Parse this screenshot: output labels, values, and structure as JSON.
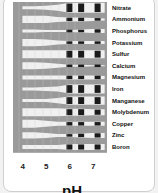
{
  "chart_data": {
    "type": "area",
    "title": "",
    "xlabel": "pH",
    "ylabel": "",
    "x_ticks": [
      "4",
      "5",
      "6",
      "7"
    ],
    "x": [
      4,
      4.5,
      5,
      5.5,
      6,
      6.5,
      7,
      7.5
    ],
    "xlim": [
      3.6,
      7.6
    ],
    "legend": "none",
    "grid": false,
    "series": [
      {
        "name": "Nitrate",
        "values": [
          0.3,
          0.3,
          0.4,
          0.6,
          1.0,
          1.0,
          1.0,
          1.0
        ]
      },
      {
        "name": "Ammonium",
        "values": [
          0.7,
          0.7,
          0.7,
          0.5,
          0.4,
          0.4,
          0.3,
          0.2
        ]
      },
      {
        "name": "Phosphorus",
        "values": [
          0.3,
          0.3,
          0.2,
          0.2,
          0.2,
          0.3,
          0.4,
          0.4
        ]
      },
      {
        "name": "Potassium",
        "values": [
          0.7,
          0.7,
          0.6,
          0.4,
          0.3,
          0.3,
          0.3,
          0.3
        ]
      },
      {
        "name": "Sulfur",
        "values": [
          0.8,
          0.8,
          0.8,
          0.8,
          0.8,
          0.8,
          0.8,
          0.8
        ]
      },
      {
        "name": "Calcium",
        "values": [
          0.7,
          0.7,
          0.6,
          0.4,
          0.2,
          0.2,
          0.1,
          0.1
        ]
      },
      {
        "name": "Magnesium",
        "values": [
          0.4,
          0.4,
          0.4,
          0.4,
          0.4,
          0.4,
          0.4,
          0.3
        ]
      },
      {
        "name": "Iron",
        "values": [
          0.3,
          0.3,
          0.4,
          0.5,
          0.9,
          0.9,
          0.9,
          0.9
        ]
      },
      {
        "name": "Manganese",
        "values": [
          0.3,
          0.3,
          0.3,
          0.5,
          0.8,
          0.8,
          0.8,
          0.8
        ]
      },
      {
        "name": "Molybdenum",
        "values": [
          0.8,
          0.8,
          0.8,
          0.8,
          0.7,
          0.7,
          0.6,
          0.6
        ]
      },
      {
        "name": "Copper",
        "values": [
          0.8,
          0.8,
          0.6,
          0.4,
          0.4,
          0.4,
          0.4,
          0.4
        ]
      },
      {
        "name": "Zinc",
        "values": [
          0.6,
          0.6,
          0.5,
          0.3,
          0.3,
          0.4,
          0.5,
          0.5
        ]
      },
      {
        "name": "Boron",
        "values": [
          0.4,
          0.4,
          0.4,
          0.4,
          0.6,
          0.6,
          0.6,
          0.6
        ]
      }
    ]
  },
  "colors": {
    "band": "#9a9a9a",
    "cell_light": "#eeeeee",
    "cell_mid": "#d6d6d6",
    "cell_dark": "#1a1a1a",
    "text": "#111111"
  }
}
